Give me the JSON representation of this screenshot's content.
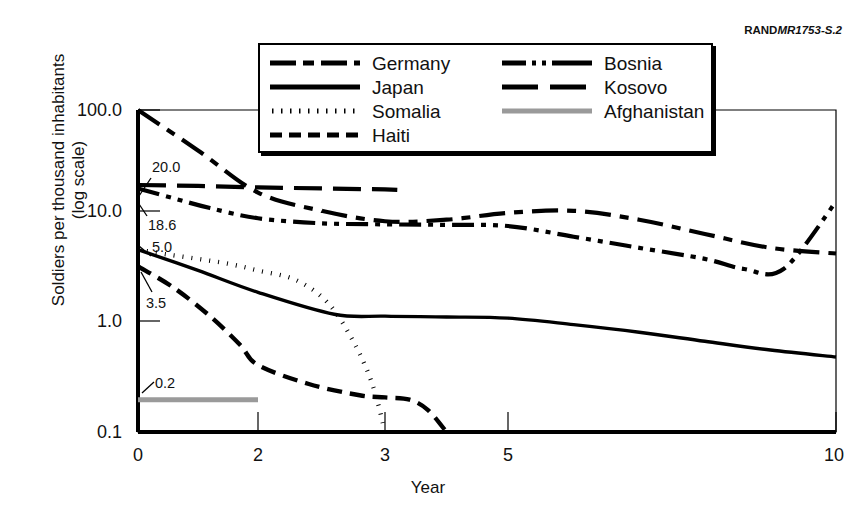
{
  "source_tag": {
    "rand": "RAND",
    "code": "MR1753-S.2"
  },
  "axes": {
    "y_title_line1": "Soldiers per thousand inhabitants",
    "y_title_line2": "(log scale)",
    "x_title": "Year",
    "y_ticks": [
      "100.0",
      "10.0",
      "1.0",
      "0.1"
    ],
    "x_ticks": [
      "0",
      "2",
      "3",
      "5",
      "10"
    ]
  },
  "annotations": [
    {
      "text": "20.0"
    },
    {
      "text": "18.6"
    },
    {
      "text": "5.0"
    },
    {
      "text": "3.5"
    },
    {
      "text": "0.2"
    }
  ],
  "legend": {
    "column_a": [
      {
        "label": "Germany",
        "style": "dash-dot-long"
      },
      {
        "label": "Japan",
        "style": "solid"
      },
      {
        "label": "Somalia",
        "style": "dotted"
      },
      {
        "label": "Haiti",
        "style": "dashed"
      }
    ],
    "column_b": [
      {
        "label": "Bosnia",
        "style": "dash-dot-dot"
      },
      {
        "label": "Kosovo",
        "style": "long-dash"
      },
      {
        "label": "Afghanistan",
        "style": "solid-gray"
      }
    ]
  },
  "note": "",
  "colors": {
    "line": "#000000",
    "afghanistan": "#9a9a9a",
    "frame": "#000000",
    "background": "#ffffff"
  },
  "chart_data": {
    "type": "line",
    "xlabel": "Year",
    "ylabel": "Soldiers per thousand inhabitants (log scale)",
    "yscale": "log",
    "ylim": [
      0.1,
      100.0
    ],
    "y_ticks": [
      0.1,
      1.0,
      10.0,
      100.0
    ],
    "x_ticks": [
      0,
      2,
      3,
      5,
      10
    ],
    "x_axis_note": "non-linear compressed axis: ticks 0,2,3,5,10 unevenly spaced",
    "grid": false,
    "legend_position": "top-center",
    "annotated_start_values": {
      "Kosovo": 20.0,
      "Bosnia": 18.6,
      "Somalia": 5.0,
      "Haiti": 3.5,
      "Afghanistan": 0.2
    },
    "series": [
      {
        "name": "Germany",
        "style": "dash-dot-long",
        "points": [
          {
            "x": 0,
            "y": 100.0
          },
          {
            "x": 1,
            "y": 42.0
          },
          {
            "x": 2,
            "y": 17.0
          },
          {
            "x": 2.5,
            "y": 11.5
          },
          {
            "x": 3,
            "y": 9.2
          },
          {
            "x": 4,
            "y": 9.5
          },
          {
            "x": 5,
            "y": 11.0
          },
          {
            "x": 6,
            "y": 11.5
          },
          {
            "x": 7,
            "y": 9.5
          },
          {
            "x": 8,
            "y": 7.0
          },
          {
            "x": 9,
            "y": 5.2
          },
          {
            "x": 10,
            "y": 4.6
          }
        ]
      },
      {
        "name": "Japan",
        "style": "solid",
        "points": [
          {
            "x": 0,
            "y": 5.0
          },
          {
            "x": 1,
            "y": 3.2
          },
          {
            "x": 2,
            "y": 2.0
          },
          {
            "x": 2.6,
            "y": 1.25
          },
          {
            "x": 3,
            "y": 1.2
          },
          {
            "x": 4,
            "y": 1.18
          },
          {
            "x": 5,
            "y": 1.15
          },
          {
            "x": 6,
            "y": 1.0
          },
          {
            "x": 7,
            "y": 0.85
          },
          {
            "x": 8,
            "y": 0.7
          },
          {
            "x": 9,
            "y": 0.58
          },
          {
            "x": 10,
            "y": 0.5
          }
        ]
      },
      {
        "name": "Somalia",
        "style": "dotted",
        "points": [
          {
            "x": 0,
            "y": 5.0
          },
          {
            "x": 0.5,
            "y": 4.5
          },
          {
            "x": 1,
            "y": 4.1
          },
          {
            "x": 1.5,
            "y": 3.7
          },
          {
            "x": 2,
            "y": 3.2
          },
          {
            "x": 2.3,
            "y": 2.6
          },
          {
            "x": 2.55,
            "y": 1.6
          },
          {
            "x": 2.75,
            "y": 0.7
          },
          {
            "x": 2.9,
            "y": 0.28
          },
          {
            "x": 3,
            "y": 0.1
          }
        ]
      },
      {
        "name": "Haiti",
        "style": "dashed",
        "points": [
          {
            "x": 0,
            "y": 3.5
          },
          {
            "x": 0.6,
            "y": 2.2
          },
          {
            "x": 1.2,
            "y": 1.2
          },
          {
            "x": 1.7,
            "y": 0.65
          },
          {
            "x": 2,
            "y": 0.42
          },
          {
            "x": 2.4,
            "y": 0.28
          },
          {
            "x": 2.8,
            "y": 0.22
          },
          {
            "x": 3,
            "y": 0.21
          },
          {
            "x": 3.4,
            "y": 0.2
          },
          {
            "x": 3.7,
            "y": 0.16
          },
          {
            "x": 4,
            "y": 0.1
          }
        ]
      },
      {
        "name": "Bosnia",
        "style": "dash-dot-dot",
        "points": [
          {
            "x": 0,
            "y": 18.6
          },
          {
            "x": 0.6,
            "y": 15.0
          },
          {
            "x": 1.2,
            "y": 12.2
          },
          {
            "x": 2,
            "y": 9.8
          },
          {
            "x": 2.5,
            "y": 8.8
          },
          {
            "x": 3,
            "y": 8.6
          },
          {
            "x": 4,
            "y": 8.5
          },
          {
            "x": 5,
            "y": 8.3
          },
          {
            "x": 6,
            "y": 6.6
          },
          {
            "x": 7,
            "y": 5.2
          },
          {
            "x": 8,
            "y": 4.1
          },
          {
            "x": 8.6,
            "y": 3.3
          },
          {
            "x": 9.2,
            "y": 3.3
          },
          {
            "x": 10,
            "y": 14.0
          }
        ]
      },
      {
        "name": "Kosovo",
        "style": "long-dash",
        "points": [
          {
            "x": 0,
            "y": 20.0
          },
          {
            "x": 1,
            "y": 19.6
          },
          {
            "x": 2,
            "y": 19.0
          },
          {
            "x": 2.5,
            "y": 18.6
          },
          {
            "x": 3,
            "y": 18.2
          },
          {
            "x": 3.2,
            "y": 18.0
          }
        ]
      },
      {
        "name": "Afghanistan",
        "style": "solid-gray",
        "points": [
          {
            "x": 0,
            "y": 0.2
          },
          {
            "x": 2,
            "y": 0.2
          }
        ]
      }
    ]
  },
  "geometry": {
    "plot_left": 138,
    "plot_right": 836,
    "plot_top": 110,
    "plot_bottom": 432,
    "x_tick_px": {
      "0": 138,
      "2": 258,
      "3": 385,
      "5": 508,
      "10": 836
    },
    "y_tick_px": {
      "100.0": 110,
      "10.0": 211,
      "1.0": 321,
      "0.1": 432
    }
  }
}
